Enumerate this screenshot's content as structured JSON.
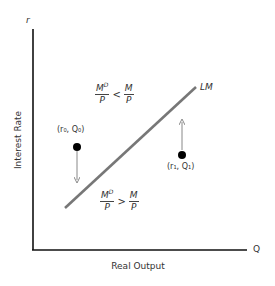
{
  "diagram": {
    "axes": {
      "y_symbol": "r",
      "x_symbol": "Q",
      "y_label": "Interest Rate",
      "x_label": "Real Output"
    },
    "curve": {
      "label": "LM",
      "color": "#777777"
    },
    "regions": {
      "above": {
        "lhs_num": "M",
        "lhs_sup": "D",
        "lhs_den": "P",
        "operator": "<",
        "rhs_num": "M",
        "rhs_den": "P"
      },
      "below": {
        "lhs_num": "M",
        "lhs_sup": "D",
        "lhs_den": "P",
        "operator": ">",
        "rhs_num": "M",
        "rhs_den": "P"
      }
    },
    "points": [
      {
        "label": "(r₀, Q₀)",
        "arrow": "down"
      },
      {
        "label": "(r₁, Q₁)",
        "arrow": "up"
      }
    ],
    "colors": {
      "axis": "#111111",
      "curve": "#777777",
      "arrow": "#888888",
      "point": "#000000",
      "text": "#333333"
    }
  }
}
